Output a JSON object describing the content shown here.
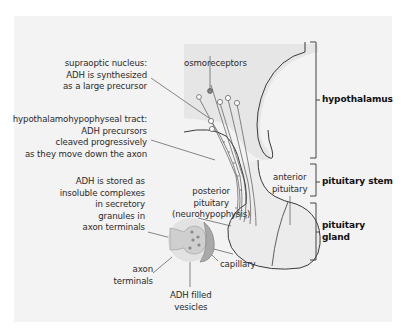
{
  "diagram": {
    "colors": {
      "background": "#ffffff",
      "panel": "#f3f3f3",
      "hypothalamus_shade": "#e4e4e4",
      "gland_fill": "#ebebeb",
      "outline": "#3a3a3a",
      "leader": "#555555",
      "axon_terminal_fill": "#d6d6d6",
      "capillary_fill": "#b8b8b8",
      "text": "#2a2a2a"
    },
    "labels": {
      "supraoptic": [
        "supraoptic nucleus:",
        "ADH is synthesized",
        "as a large precursor"
      ],
      "tract": [
        "hypothalamohypophyseal tract:",
        "ADH precursors",
        "cleaved progressively",
        "as they move down the axon"
      ],
      "osmoreceptors": "osmoreceptors",
      "posterior": [
        "posterior",
        "pituitary",
        "(neurohypophysis)"
      ],
      "anterior": [
        "anterior",
        "pituitary"
      ],
      "storage": [
        "ADH is stored as",
        "insoluble complexes",
        "in secretory",
        "granules in",
        "axon terminals"
      ],
      "axon_terminals": [
        "axon",
        "terminals"
      ],
      "vesicles": [
        "ADH filled",
        "vesicles"
      ],
      "capillary": "capillary"
    },
    "brackets": {
      "hypothalamus": "hypothalamus",
      "stem": "pituitary stem",
      "gland": [
        "pituitary",
        "gland"
      ]
    }
  }
}
